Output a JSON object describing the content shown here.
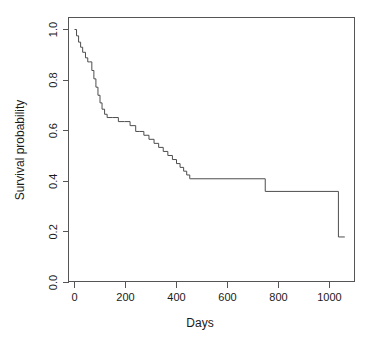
{
  "chart_data": {
    "type": "line",
    "subtype": "kaplan-meier-step",
    "title": "",
    "xlabel": "Days",
    "ylabel": "Survival probability",
    "xlim": [
      -30,
      1120
    ],
    "ylim": [
      -0.04,
      1.04
    ],
    "xticks": [
      0,
      200,
      400,
      600,
      800,
      1000
    ],
    "xtick_labels": [
      "0",
      "200",
      "400",
      "600",
      "800",
      "1000"
    ],
    "yticks": [
      0.0,
      0.2,
      0.4,
      0.6,
      0.8,
      1.0
    ],
    "ytick_labels": [
      "0.0",
      "0.2",
      "0.4",
      "0.6",
      "0.8",
      "1.0"
    ],
    "grid": false,
    "legend": false,
    "legend_position": "none",
    "line_color": "#4d4d4d",
    "axis_color": "#555555",
    "background_color": "#ffffff",
    "box_frame": true,
    "series": [
      {
        "name": "Survival probability",
        "step": "post",
        "x": [
          0,
          8,
          16,
          24,
          32,
          43,
          52,
          60,
          68,
          76,
          84,
          92,
          100,
          108,
          118,
          128,
          150,
          172,
          196,
          218,
          240,
          256,
          272,
          292,
          312,
          330,
          348,
          366,
          384,
          400,
          414,
          428,
          440,
          452,
          456,
          748,
          1035,
          1060
        ],
        "y": [
          1.0,
          0.975,
          0.95,
          0.93,
          0.91,
          0.888,
          0.872,
          0.872,
          0.838,
          0.805,
          0.772,
          0.74,
          0.71,
          0.685,
          0.665,
          0.652,
          0.652,
          0.636,
          0.636,
          0.62,
          0.597,
          0.597,
          0.582,
          0.566,
          0.55,
          0.534,
          0.518,
          0.502,
          0.486,
          0.47,
          0.455,
          0.44,
          0.425,
          0.41,
          0.41,
          0.36,
          0.18,
          0.18
        ]
      }
    ],
    "annotations": [
      {
        "text": "curve starts at survival probability 1.0 at day 0"
      },
      {
        "text": "long plateau at 0.41 between day 456 and day 748"
      },
      {
        "text": "plateau at 0.36 between day 748 and day 1035"
      },
      {
        "text": "final drop to 0.18 near day 1035"
      }
    ]
  },
  "axes": {
    "x_title": "Days",
    "y_title": "Survival probability"
  }
}
